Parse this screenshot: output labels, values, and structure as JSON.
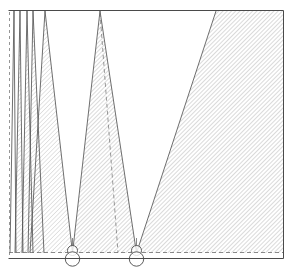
{
  "figure": {
    "kind": "engraved line diagram",
    "frame": {
      "left": 8.5,
      "right": 283.5,
      "top": 10.5,
      "bottom": 258.5,
      "stroke_color": "#4a4a4a",
      "stroke_width": 1
    },
    "baseline": {
      "label": "ground-line",
      "y": 258.5,
      "stroke_color": "#3f3f3f"
    },
    "dashed_baseline": {
      "label": "chord-line",
      "y": 252.5,
      "x_start": 9,
      "x_end": 283,
      "stroke_color": "#6d6d6d",
      "dash": "4 3"
    },
    "dashed_left_edge": {
      "label": "left-datum",
      "x": 9.5,
      "y_start": 12,
      "y_end": 257,
      "stroke_color": "#7a7a7a",
      "dash": "3 3"
    },
    "hatch": {
      "angle_deg": 45,
      "spacing_px": 3,
      "stroke_color": "#8c8c8c",
      "stroke_width": 0.6
    },
    "nodes": [
      {
        "name": "left-pivot",
        "cx": 72.5,
        "cy": 256.5,
        "r_outer": 7.2,
        "r_inner": 5.0,
        "stroke_color": "#4a4a4a"
      },
      {
        "name": "right-pivot",
        "cx": 136.5,
        "cy": 256.5,
        "r_outer": 7.2,
        "r_inner": 5.0,
        "stroke_color": "#4a4a4a"
      }
    ],
    "wedges": [
      {
        "name": "sliver-1",
        "apex_x": 14.0,
        "base_left": 10.0,
        "base_right": 16.0,
        "shaded": false
      },
      {
        "name": "sliver-2",
        "apex_x": 20.0,
        "base_left": 15.0,
        "base_right": 23.0,
        "shaded": true
      },
      {
        "name": "sliver-3",
        "apex_x": 27.0,
        "base_left": 22.0,
        "base_right": 33.0,
        "shaded": true
      },
      {
        "name": "sliver-4",
        "apex_x": 33.0,
        "base_left": 28.0,
        "base_right": 44.0,
        "shaded": true
      },
      {
        "name": "wedge-left-major",
        "apex_x": 45.0,
        "base_left": 38.0,
        "base_right": 66.0,
        "shaded": true
      }
    ],
    "cones": [
      {
        "name": "left-shadow-cone",
        "apex_x": 45.0,
        "apex_y": 11.0,
        "foot_x": 72.5,
        "foot_y": 252.5,
        "shaded": true
      },
      {
        "name": "centre-shadow-cone",
        "apex_x": 100.0,
        "apex_y": 11.0,
        "left_foot_x": 72.5,
        "right_foot_x": 136.5,
        "foot_y": 252.5,
        "shaded": true
      },
      {
        "name": "right-shadow-cone",
        "apex_x": 216.0,
        "apex_y": 11.0,
        "foot_x": 136.5,
        "foot_y": 252.5,
        "shaded": true
      }
    ],
    "regions": [
      {
        "name": "left-hatched-field",
        "shaded": true,
        "description": "narrow hatched band left of first cone"
      },
      {
        "name": "left-white-void",
        "shaded": false,
        "description": "clear triangle between left and centre cones"
      },
      {
        "name": "right-white-void",
        "shaded": false,
        "description": "clear triangle between centre and right cones"
      },
      {
        "name": "right-hatched-field",
        "shaded": true,
        "description": "large hatched field filling the right of the plate"
      }
    ],
    "construction_lines": [
      {
        "name": "centre-axis-dashed",
        "from_x": 100.0,
        "from_y": 13.0,
        "to_x": 118.0,
        "to_y": 252.5,
        "dash": "4 3"
      },
      {
        "name": "left-node-riser",
        "from_x": 72.5,
        "from_y": 236.0,
        "to_x": 72.5,
        "to_y": 252.0,
        "dash": "0"
      },
      {
        "name": "right-node-riser",
        "from_x": 136.5,
        "from_y": 236.0,
        "to_x": 136.5,
        "to_y": 252.0,
        "dash": "0"
      }
    ],
    "caption": ""
  }
}
